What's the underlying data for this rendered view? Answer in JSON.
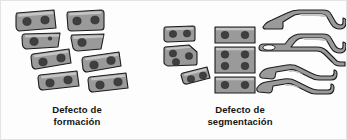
{
  "figure": {
    "background_color": "#fdfdfd",
    "border_color": "#e3e3e3"
  },
  "style": {
    "shape_fill": "#9a9a9a",
    "shape_stroke": "#1c1c1c",
    "shape_highlight": "#c9c9c9",
    "dot_fill": "#3f3f3f",
    "hole_fill": "#fdfdfd",
    "text_color": "#141414"
  },
  "captions": {
    "left": {
      "line1": "Defecto de",
      "line2": "formación",
      "full": "Defecto de formación"
    },
    "right": {
      "line1": "Defecto de",
      "line2": "segmentación",
      "full": "Defecto de segmentación"
    }
  },
  "panels": [
    {
      "id": "formacion",
      "label": "Defecto de formación",
      "description": "Dos columnas de vertebras irregulares (cuneiformes y hemivertebras) con dos puntos cada una",
      "groups": [
        {
          "id": "left-column",
          "shapes": [
            {
              "name": "vertebra-block-1",
              "dots": 2,
              "form": "rectangular-tilted"
            },
            {
              "name": "vertebra-block-2",
              "dots": 2,
              "form": "wedge",
              "extra_small_dot": true
            },
            {
              "name": "vertebra-block-3",
              "dots": 2,
              "form": "rectangular-tilted"
            },
            {
              "name": "vertebra-block-4",
              "dots": 2,
              "form": "rectangular-tilted"
            }
          ]
        },
        {
          "id": "right-column",
          "shapes": [
            {
              "name": "vertebra-block-5",
              "dots": 2,
              "form": "trapezoid"
            },
            {
              "name": "vertebra-block-6",
              "dots": 1,
              "form": "wedge"
            },
            {
              "name": "vertebra-block-7",
              "dots": 2,
              "form": "rectangular-tilted"
            },
            {
              "name": "vertebra-block-8",
              "dots": 2,
              "form": "rectangular-tilted"
            }
          ]
        }
      ]
    },
    {
      "id": "segmentacion",
      "label": "Defecto de segmentación",
      "description": "Bloques vertebrales fusionados y barras oseas alargadas",
      "groups": [
        {
          "id": "left-cluster",
          "shapes": [
            {
              "name": "vertebra-block-9",
              "dots": 2,
              "form": "rectangular-tilted"
            },
            {
              "name": "vertebra-block-10",
              "dots": 3,
              "form": "pentagon"
            },
            {
              "name": "vertebra-block-11",
              "dots": 2,
              "form": "rectangular-tilted"
            }
          ]
        },
        {
          "id": "middle-cluster",
          "shapes": [
            {
              "name": "fused-block-1",
              "dots": 2,
              "form": "rectangle"
            },
            {
              "name": "fused-block-2",
              "dots": 4,
              "form": "rectangle"
            },
            {
              "name": "fused-block-3",
              "dots": 2,
              "form": "rectangle"
            }
          ]
        },
        {
          "id": "bar-cluster",
          "shapes": [
            {
              "name": "bony-bar-1",
              "dots": 0,
              "form": "elongated-bar"
            },
            {
              "name": "bony-bar-2",
              "dots": 0,
              "form": "elongated-bar-with-hole",
              "has_hole": true
            },
            {
              "name": "bony-bar-3",
              "dots": 0,
              "form": "elongated-bar"
            },
            {
              "name": "bony-bar-4",
              "dots": 0,
              "form": "elongated-bar"
            }
          ]
        }
      ]
    }
  ]
}
